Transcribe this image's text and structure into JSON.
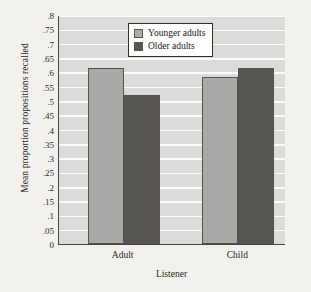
{
  "chart_data": {
    "type": "bar",
    "title": "",
    "xlabel": "Listener",
    "ylabel": "Mean proportion propositions recalled",
    "categories": [
      "Adult",
      "Child"
    ],
    "series": [
      {
        "name": "Younger adults",
        "color": "#a9a9a7",
        "values": [
          0.615,
          0.585
        ]
      },
      {
        "name": "Older adults",
        "color": "#575653",
        "values": [
          0.52,
          0.615
        ]
      }
    ],
    "ylim": [
      0,
      0.8
    ],
    "ytick_step": 0.05,
    "ytick_labels": [
      ".8",
      ".75",
      ".7",
      ".65",
      ".6",
      ".55",
      ".5",
      ".45",
      ".4",
      ".35",
      ".3",
      ".25",
      ".2",
      ".15",
      ".1",
      ".05",
      "0"
    ],
    "ytick_values": [
      0.8,
      0.75,
      0.7,
      0.65,
      0.6,
      0.55,
      0.5,
      0.45,
      0.4,
      0.35,
      0.3,
      0.25,
      0.2,
      0.15,
      0.1,
      0.05,
      0
    ],
    "grid": true,
    "grid_color": "#fbfbfa",
    "plot_background": "#dbdbd9",
    "page_background": "#f2f1ed",
    "axis_color": "#4a4742",
    "legend_position": "top-center",
    "legend_entries": [
      "Younger adults",
      "Older adults"
    ]
  }
}
